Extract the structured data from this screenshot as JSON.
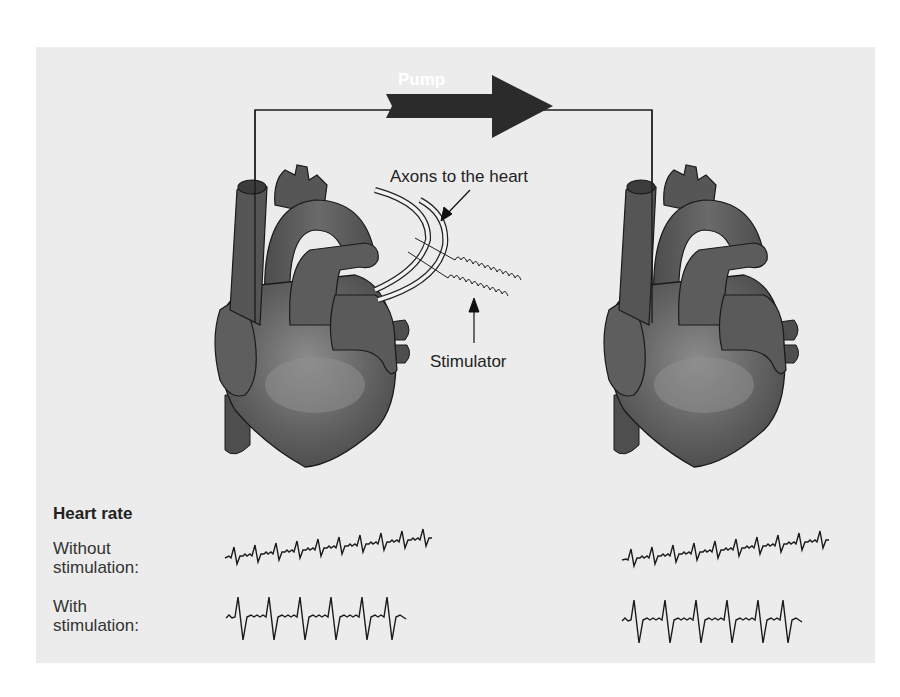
{
  "diagram": {
    "pump_label": "Pump",
    "axons_label": "Axons to the heart",
    "stimulator_label": "Stimulator",
    "left_heart": "stimulated donor heart",
    "right_heart": "recipient heart"
  },
  "heart_rate": {
    "title": "Heart rate",
    "rows": [
      {
        "label_line1": "Without",
        "label_line2": "stimulation:"
      },
      {
        "label_line1": "With",
        "label_line2": "stimulation:"
      }
    ]
  },
  "colors": {
    "panel_bg": "#ececec",
    "heart_fill": "#5a5a5a",
    "heart_highlight": "#8a8a8a",
    "arrow_fill": "#2b2b2b",
    "line": "#1a1a1a"
  }
}
